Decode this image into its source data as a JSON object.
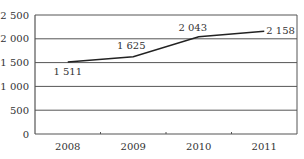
{
  "chart_data": {
    "type": "line",
    "title": "",
    "xlabel": "",
    "ylabel": "",
    "categories": [
      "2008",
      "2009",
      "2010",
      "2011"
    ],
    "series": [
      {
        "name": "",
        "values": [
          1511,
          1625,
          2043,
          2158
        ]
      }
    ],
    "data_labels": [
      "1 511",
      "1 625",
      "2 043",
      "2 158"
    ],
    "ylim": [
      0,
      2500
    ],
    "yticks": [
      0,
      500,
      1000,
      1500,
      2000,
      2500
    ],
    "ytick_labels": [
      "0",
      "500",
      "1 000",
      "1 500",
      "2 000",
      "2 500"
    ],
    "grid": true,
    "legend": "none"
  },
  "style": {
    "line_color": "#222222",
    "grid_color": "#555555",
    "text_color": "#333333",
    "background": "#ffffff"
  }
}
